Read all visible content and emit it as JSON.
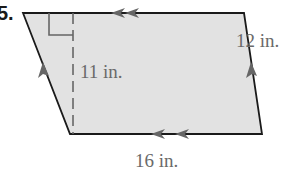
{
  "problem": {
    "number": "5."
  },
  "diagram": {
    "shape": "parallelogram",
    "fill": "#e2e2e2",
    "stroke": "#1a1a1a",
    "arrow_color": "#666666",
    "labels": {
      "height": "11 in.",
      "side": "12 in.",
      "base": "16 in."
    }
  }
}
